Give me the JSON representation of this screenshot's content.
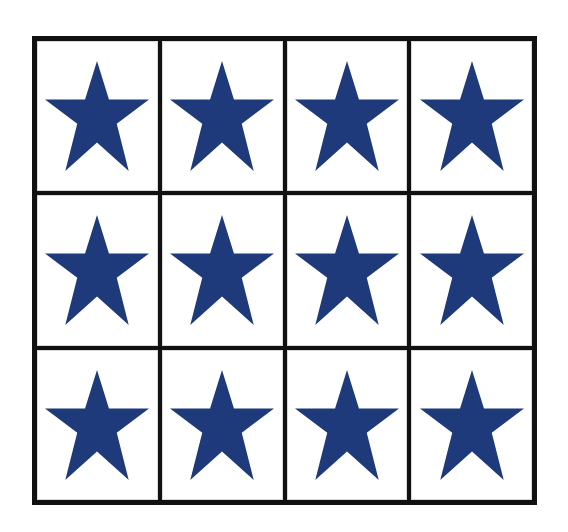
{
  "grid": {
    "rows": 3,
    "columns": 4,
    "border_color": "#111111",
    "cell_background": "#ffffff"
  },
  "cells": [
    {
      "row": 1,
      "col": 1,
      "icon": "star-icon",
      "color": "#1f3a7a"
    },
    {
      "row": 1,
      "col": 2,
      "icon": "star-icon",
      "color": "#1f3a7a"
    },
    {
      "row": 1,
      "col": 3,
      "icon": "star-icon",
      "color": "#1f3a7a"
    },
    {
      "row": 1,
      "col": 4,
      "icon": "star-icon",
      "color": "#1f3a7a"
    },
    {
      "row": 2,
      "col": 1,
      "icon": "star-icon",
      "color": "#1f3a7a"
    },
    {
      "row": 2,
      "col": 2,
      "icon": "star-icon",
      "color": "#1f3a7a"
    },
    {
      "row": 2,
      "col": 3,
      "icon": "star-icon",
      "color": "#1f3a7a"
    },
    {
      "row": 2,
      "col": 4,
      "icon": "star-icon",
      "color": "#1f3a7a"
    },
    {
      "row": 3,
      "col": 1,
      "icon": "star-icon",
      "color": "#1f3a7a"
    },
    {
      "row": 3,
      "col": 2,
      "icon": "star-icon",
      "color": "#1f3a7a"
    },
    {
      "row": 3,
      "col": 3,
      "icon": "star-icon",
      "color": "#1f3a7a"
    },
    {
      "row": 3,
      "col": 4,
      "icon": "star-icon",
      "color": "#1f3a7a"
    }
  ]
}
